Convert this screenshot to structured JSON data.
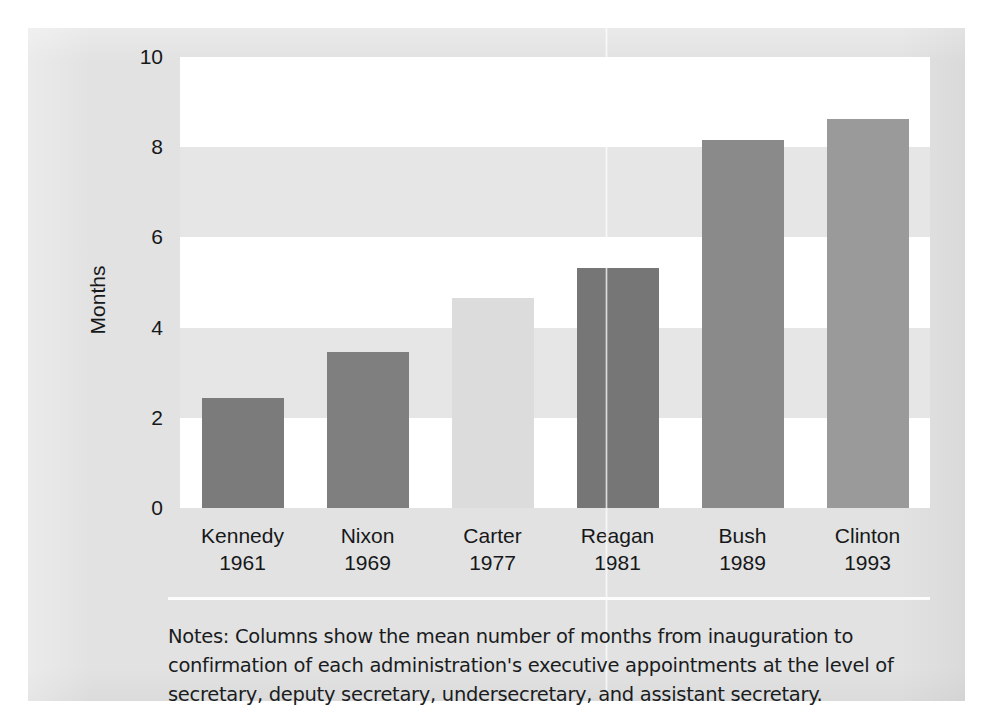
{
  "figure": {
    "background_color": "#e2e2e2",
    "band_light_color": "#ffffff",
    "band_dark_color": "#e6e6e6",
    "text_color": "#16181a"
  },
  "notes": {
    "text": "Notes: Columns show the mean number of months from inauguration to confirmation of each administration's executive appointments at the level of secretary, deputy secretary, undersecretary, and assistant secretary."
  },
  "chart_data": {
    "type": "bar",
    "title": "",
    "xlabel": "",
    "ylabel": "Months",
    "ylim": [
      0,
      10
    ],
    "yticks": [
      0,
      2,
      4,
      6,
      8,
      10
    ],
    "ytick_labels": [
      "0",
      "2",
      "4",
      "6",
      "8",
      "10"
    ],
    "grid": "alternating horizontal bands every 2 units",
    "legend": "none",
    "categories": [
      "Kennedy",
      "Nixon",
      "Carter",
      "Reagan",
      "Bush",
      "Clinton"
    ],
    "category_sublabels": [
      "1961",
      "1969",
      "1977",
      "1981",
      "1989",
      "1993"
    ],
    "values": [
      2.44,
      3.46,
      4.65,
      5.32,
      8.15,
      8.62
    ],
    "bars": [
      {
        "label": "Kennedy",
        "sublabel": "1961",
        "value": 2.44,
        "color": "#7b7b7b"
      },
      {
        "label": "Nixon",
        "sublabel": "1969",
        "value": 3.46,
        "color": "#7f7f7f"
      },
      {
        "label": "Carter",
        "sublabel": "1977",
        "value": 4.65,
        "color": "#dcdcdc"
      },
      {
        "label": "Reagan",
        "sublabel": "1981",
        "value": 5.32,
        "color": "#767676"
      },
      {
        "label": "Bush",
        "sublabel": "1989",
        "value": 8.15,
        "color": "#8a8a8a"
      },
      {
        "label": "Clinton",
        "sublabel": "1993",
        "value": 8.62,
        "color": "#9a9a9a"
      }
    ]
  }
}
